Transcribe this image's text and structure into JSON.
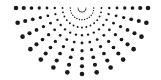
{
  "graphic": {
    "name": "radial half-sun dot pattern",
    "dot_color": "#1a1a1a",
    "background": "#ffffff",
    "center": {
      "x": 82,
      "y": 8
    },
    "rays": 15,
    "start_angle_deg": 0,
    "end_angle_deg": 180,
    "dots_per_ray": 9,
    "inner_radius": 4,
    "outer_radius": 66,
    "min_dot_radius": 0.5,
    "max_dot_radius": 2.3
  }
}
